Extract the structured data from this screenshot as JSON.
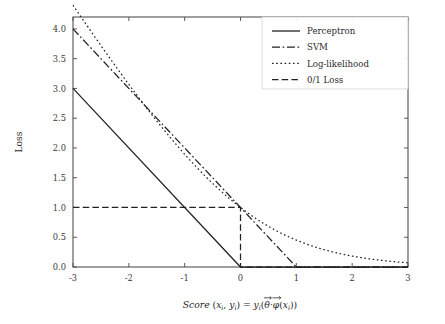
{
  "chart_data": {
    "type": "line",
    "title": "",
    "xlabel": "Score (x_i, y_i) = y_i(θ⃗·φ⃗(x_i))",
    "ylabel": "Loss",
    "xlim": [
      -3,
      3
    ],
    "ylim": [
      0.0,
      4.2
    ],
    "grid": false,
    "legend_position": "upper right",
    "x_ticks": [
      "-3",
      "-2",
      "-1",
      "0",
      "1",
      "2",
      "3"
    ],
    "x_tick_values": [
      -3,
      -2,
      -1,
      0,
      1,
      2,
      3
    ],
    "y_ticks": [
      "0.0",
      "0.5",
      "1.0",
      "1.5",
      "2.0",
      "2.5",
      "3.0",
      "3.5",
      "4.0"
    ],
    "y_tick_values": [
      0.0,
      0.5,
      1.0,
      1.5,
      2.0,
      2.5,
      3.0,
      3.5,
      4.0
    ],
    "x": [
      -3,
      -2.5,
      -2,
      -1.5,
      -1,
      -0.5,
      0,
      0.5,
      1,
      1.5,
      2,
      2.5,
      3
    ],
    "series": [
      {
        "name": "Perceptron",
        "linestyle": "solid",
        "color": "#222222",
        "formula": "max(0, -z)",
        "values": [
          3.0,
          2.5,
          2.0,
          1.5,
          1.0,
          0.5,
          0.0,
          0.0,
          0.0,
          0.0,
          0.0,
          0.0,
          0.0
        ]
      },
      {
        "name": "SVM",
        "linestyle": "dashdot",
        "color": "#222222",
        "formula": "max(0, 1 - z)",
        "values": [
          4.0,
          3.5,
          3.0,
          2.5,
          2.0,
          1.5,
          1.0,
          0.5,
          0.0,
          0.0,
          0.0,
          0.0,
          0.0
        ]
      },
      {
        "name": "Log-likelihood",
        "linestyle": "dotted",
        "color": "#222222",
        "formula": "log2(1 + e^(-z))",
        "values": [
          3.05,
          2.56,
          2.07,
          1.61,
          1.19,
          0.83,
          0.55,
          0.34,
          0.2,
          0.11,
          0.06,
          0.03,
          0.015
        ]
      },
      {
        "name": "0/1 Loss",
        "linestyle": "dashed",
        "color": "#222222",
        "formula": "1 if z < 0 else 0",
        "values": [
          1.0,
          1.0,
          1.0,
          1.0,
          1.0,
          1.0,
          0.0,
          0.0,
          0.0,
          0.0,
          0.0,
          0.0,
          0.0
        ]
      }
    ]
  },
  "legend": {
    "entries": [
      {
        "label": "Perceptron"
      },
      {
        "label": "SVM"
      },
      {
        "label": "Log-likelihood"
      },
      {
        "label": "0/1 Loss"
      }
    ]
  },
  "axes": {
    "y_label": "Loss",
    "x_label_parts": {
      "score": "Score",
      "open": " (",
      "x_sym": "x",
      "x_sub": "i",
      "comma": ", ",
      "y_sym": "y",
      "y_sub": "i",
      "close": ") = ",
      "y2_sym": "y",
      "y2_sub": "i",
      "paren_open": "(",
      "theta": "θ",
      "dot": "·",
      "phi": "φ",
      "paren_x_open": "(",
      "x3_sym": "x",
      "x3_sub": "i",
      "paren_close": "))"
    }
  }
}
